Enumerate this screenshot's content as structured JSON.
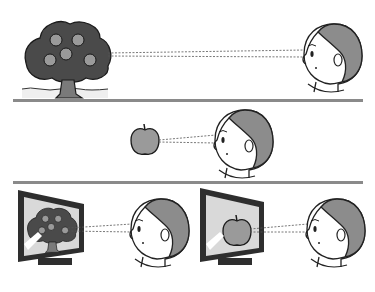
{
  "illustration": {
    "description": "Child viewing an apple tree at distance, an apple close up, and the same images on monitors",
    "panels": [
      {
        "id": "far-tree",
        "subject": "apple tree",
        "viewer": "child"
      },
      {
        "id": "near-apple",
        "subject": "apple",
        "viewer": "child"
      },
      {
        "id": "monitors",
        "subjects": [
          "apple tree on monitor",
          "apple on monitor"
        ],
        "viewer": "child"
      }
    ]
  },
  "colors": {
    "divider": "#8a8a8a",
    "hair": "#8c8c8c",
    "tree_crown": "#4a4a4a",
    "fruit": "#9a9a9a",
    "monitor_frame": "#2e2e2e",
    "screen": "#d9d9d9",
    "outline": "#222222"
  }
}
